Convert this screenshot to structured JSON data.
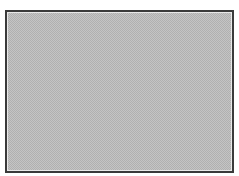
{
  "frame": {
    "border_color": "#3a3a3a",
    "fill_light": "#c4c4c4",
    "fill_dark": "#b0b0b0",
    "pattern": "dithered-checkerboard"
  }
}
